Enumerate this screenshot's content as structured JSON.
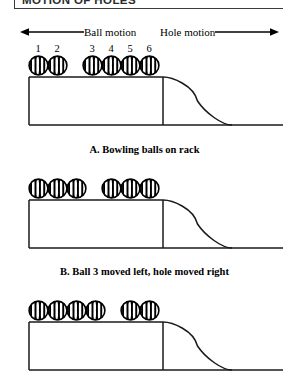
{
  "header": {
    "title": "MOTION OF HOLES",
    "rule_color": "#3a3a3a"
  },
  "motion": {
    "ball_label": "Ball motion",
    "ball_arrow_icon": "arrow-left-icon",
    "hole_label": "Hole motion",
    "hole_arrow_icon": "arrow-right-icon"
  },
  "ball_numbers": [
    {
      "label": "1",
      "x": 38
    },
    {
      "label": "2",
      "x": 57
    },
    {
      "label": "3",
      "x": 92
    },
    {
      "label": "4",
      "x": 111
    },
    {
      "label": "5",
      "x": 130
    },
    {
      "label": "6",
      "x": 149
    }
  ],
  "diagrams": [
    {
      "id": "diagram-a",
      "caption": "A. Bowling balls on rack",
      "ball_positions": [
        38,
        57,
        92,
        111,
        130,
        149
      ]
    },
    {
      "id": "diagram-b",
      "caption": "B. Ball 3 moved left, hole moved right",
      "ball_positions": [
        38,
        57,
        76,
        111,
        130,
        149
      ]
    },
    {
      "id": "diagram-c",
      "caption": "",
      "ball_positions": [
        38,
        57,
        76,
        95,
        130,
        149
      ]
    }
  ],
  "rack": {
    "left_wall_x": 29,
    "platform_top_y": 22,
    "platform_right_x": 163,
    "baseline_y": 70,
    "ramp_end_x": 232,
    "baseline_right_x": 283,
    "stroke_color": "#1a1a1a"
  },
  "ball_style": {
    "outline_color": "#000000",
    "hatch_color": "#000000",
    "fill_color": "#ffffff"
  }
}
